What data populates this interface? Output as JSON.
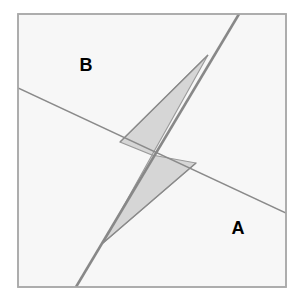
{
  "figure": {
    "type": "geometry-diagram",
    "canvas": {
      "width": 303,
      "height": 301,
      "background": "#ffffff"
    },
    "colors": {
      "page_background": "#ffffff",
      "square_fill": "#f7f7f7",
      "square_stroke": "#aaaaaa",
      "thin_line_stroke": "#8a8a8a",
      "thick_line_stroke": "#888888",
      "shaded_fill": "#d6d6d6",
      "shaded_stroke": "#9a9a9a",
      "label_color": "#000000"
    },
    "square": {
      "name": "bounding-square",
      "x": 18,
      "y": 14,
      "width": 268,
      "height": 273,
      "stroke_width": 1.6
    },
    "lines": [
      {
        "name": "transversal-line",
        "x1": 18,
        "y1": 88,
        "x2": 286,
        "y2": 213,
        "stroke_width": 1.4,
        "color": "#8a8a8a"
      },
      {
        "name": "main-diagonal-line",
        "x1": 239,
        "y1": 14,
        "x2": 76,
        "y2": 287,
        "stroke_width": 2.6,
        "color": "#888888"
      }
    ],
    "shaded_polygons": [
      {
        "name": "upper-shaded-triangle",
        "points": "208,55 152,155 120,142",
        "fill": "#d6d6d6"
      },
      {
        "name": "lower-shaded-triangle",
        "points": "152,155 196,163 103,243",
        "fill": "#d6d6d6"
      }
    ],
    "labels": [
      {
        "name": "region-label-b",
        "text": "B",
        "x": 86,
        "y": 65
      },
      {
        "name": "region-label-a",
        "text": "A",
        "x": 238,
        "y": 228
      }
    ]
  }
}
